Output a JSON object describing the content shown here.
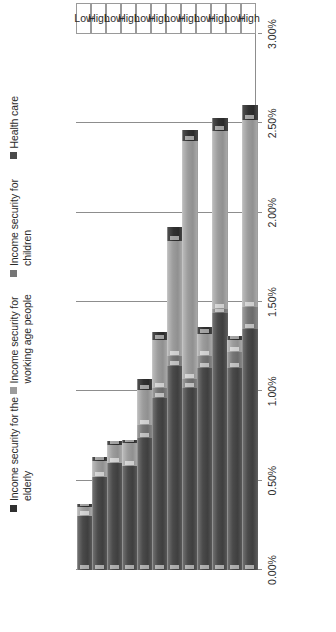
{
  "legend": {
    "items": [
      {
        "label": "Income security for the elderly",
        "color": "#303030",
        "key": "elderly"
      },
      {
        "label": "Income security for working age people",
        "color": "#9c9c9c",
        "key": "working"
      },
      {
        "label": "Income security for children",
        "color": "#767676",
        "key": "children"
      },
      {
        "label": "Health care",
        "color": "#4a4a4a",
        "key": "health"
      }
    ]
  },
  "axis": {
    "ticks": [
      "0.00%",
      "0.50%",
      "1.00%",
      "1.50%",
      "2.00%",
      "2.50%",
      "3.00%"
    ],
    "min": 0,
    "max": 3.0,
    "step": 0.5
  },
  "categories": [
    "Low",
    "High",
    "Low",
    "High",
    "Low",
    "High",
    "Low",
    "High",
    "Low",
    "High",
    "Low",
    "High"
  ],
  "chart_data": {
    "type": "bar",
    "orientation": "horizontal-stacked",
    "title": "",
    "xlabel": "",
    "ylabel": "",
    "xlim": [
      0,
      3.0
    ],
    "grid": true,
    "legend_position": "top",
    "categories": [
      "Low",
      "High",
      "Low",
      "High",
      "Low",
      "High",
      "Low",
      "High",
      "Low",
      "High",
      "Low",
      "High"
    ],
    "series": [
      {
        "name": "Health care",
        "color": "#4a4a4a",
        "values": [
          0.3,
          0.52,
          0.6,
          0.58,
          0.74,
          0.96,
          1.14,
          1.02,
          1.13,
          1.44,
          1.13,
          1.35
        ]
      },
      {
        "name": "Income security for children",
        "color": "#767676",
        "values": [
          0.0,
          0.0,
          0.0,
          0.0,
          0.07,
          0.06,
          0.06,
          0.05,
          0.07,
          0.02,
          0.09,
          0.12
        ]
      },
      {
        "name": "Income security for working age people",
        "color": "#9c9c9c",
        "values": [
          0.05,
          0.09,
          0.1,
          0.13,
          0.2,
          0.27,
          0.64,
          1.33,
          0.12,
          1.0,
          0.07,
          1.05
        ]
      },
      {
        "name": "Income security for the elderly",
        "color": "#303030",
        "values": [
          0.02,
          0.02,
          0.02,
          0.02,
          0.06,
          0.04,
          0.08,
          0.06,
          0.04,
          0.07,
          0.02,
          0.08
        ]
      }
    ],
    "totals": [
      0.37,
      0.63,
      0.72,
      0.73,
      1.07,
      1.33,
      1.92,
      2.46,
      1.36,
      2.53,
      1.31,
      2.6
    ]
  }
}
